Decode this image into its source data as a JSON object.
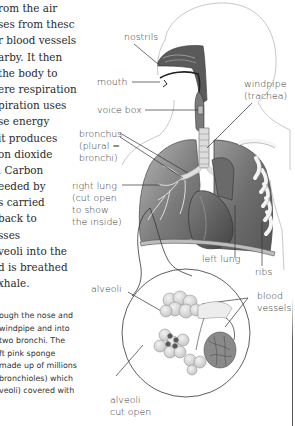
{
  "body_text": {
    "lines": [
      "rom the air",
      "ses from thesc",
      "r blood vessels",
      "arby. It then",
      "the body to",
      "ere respiration",
      "piration uses",
      "se energy",
      "it produces",
      "on dioxide",
      ". Carbon",
      "eeded by",
      "s carried",
      " back to",
      "sses",
      "veoli into the",
      "d is breathed",
      "xhale."
    ]
  },
  "caption": {
    "lines": [
      "ough the nose and",
      "windpipe and into",
      "two bronchi. The",
      "ft pink sponge",
      "made up of millions",
      "bronchioles) which",
      "veoli) covered with"
    ]
  },
  "diagram": {
    "colors": {
      "line": "#333333",
      "tissue_dark": "#5a5a5a",
      "tissue_mid": "#8a8a8a",
      "tissue_light": "#c8c8c8",
      "outline": "#bdbdbd"
    },
    "labels": {
      "nostrils": [
        "nostrils"
      ],
      "mouth": [
        "mouth"
      ],
      "voice_box": [
        "voice box"
      ],
      "windpipe": [
        "windpipe",
        "(trachea)"
      ],
      "bronchus": [
        "bronchus",
        "(plural =",
        "bronchi)"
      ],
      "right_lung": [
        "right lung",
        "(cut open",
        "to show",
        "the inside)"
      ],
      "left_lung": [
        "left lung"
      ],
      "ribs": [
        "ribs"
      ],
      "alveoli": [
        "alveoli"
      ],
      "blood_vessels": [
        "blood",
        "vessels"
      ],
      "alveoli_cut_open": [
        "alveoli",
        "cut open"
      ]
    }
  }
}
